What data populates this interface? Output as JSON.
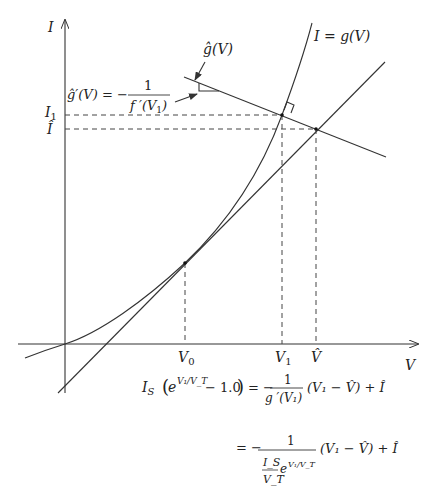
{
  "axes": {
    "y_label": "I",
    "x_label": "V"
  },
  "ticks": {
    "x": [
      {
        "label": "V",
        "sub": "0"
      },
      {
        "label": "V",
        "sub": "1"
      },
      {
        "label": "V̂",
        "sub": ""
      }
    ],
    "y": [
      {
        "label": "I",
        "sub": "1"
      },
      {
        "label": "Î",
        "sub": ""
      }
    ]
  },
  "curves": {
    "g_label": "I = g(V)",
    "ghat_label": "ĝ(V)",
    "slope_annotation": {
      "lhs": "ĝ′(V) = −",
      "numerator": "1",
      "denominator_f": "f ′(V",
      "denominator_sub": "1",
      "denominator_close": ")"
    }
  },
  "equations": {
    "line1": {
      "lhs_I": "I",
      "lhs_sub": "S",
      "exp_base": "e",
      "exp_power": "V₁/V_T",
      "minus_const": "− 1.0",
      "equals": "= −",
      "frac_num": "1",
      "frac_den": "g ′(V₁)",
      "rhs": "(V₁ − V̂) + Î"
    },
    "line2": {
      "equals": "= −",
      "frac_num": "1",
      "frac_den_num": "I_S",
      "frac_den_den": "V_T",
      "frac_den_exp": "V₁/V_T",
      "rhs": "(V₁ − V̂) + Î"
    }
  }
}
